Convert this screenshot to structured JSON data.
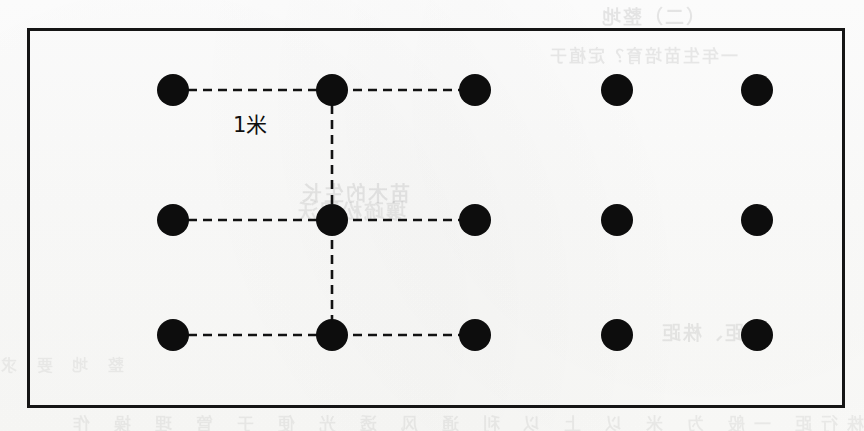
{
  "figure": {
    "kind": "planting-spacing-grid-diagram",
    "spacing_label": "1米",
    "frame": {
      "x": 27,
      "y": 28,
      "width": 818,
      "height": 380,
      "border_color": "#151515",
      "border_width": 3
    },
    "background_color": "#fdfdfc",
    "dot_color": "#0d0d0d",
    "dot_radius": 16,
    "line_color": "#121212",
    "line_style": "dashed",
    "columns": 5,
    "rows": 3,
    "column_x": [
      173,
      332,
      475,
      617,
      757
    ],
    "row_y": [
      90,
      220,
      335
    ],
    "dots": [
      {
        "id": "r1c1",
        "row": 1,
        "col": 1,
        "cx": 173,
        "cy": 90
      },
      {
        "id": "r1c2",
        "row": 1,
        "col": 2,
        "cx": 332,
        "cy": 90
      },
      {
        "id": "r1c3",
        "row": 1,
        "col": 3,
        "cx": 475,
        "cy": 90
      },
      {
        "id": "r1c4",
        "row": 1,
        "col": 4,
        "cx": 617,
        "cy": 90
      },
      {
        "id": "r1c5",
        "row": 1,
        "col": 5,
        "cx": 757,
        "cy": 90
      },
      {
        "id": "r2c1",
        "row": 2,
        "col": 1,
        "cx": 173,
        "cy": 220
      },
      {
        "id": "r2c2",
        "row": 2,
        "col": 2,
        "cx": 332,
        "cy": 220
      },
      {
        "id": "r2c3",
        "row": 2,
        "col": 3,
        "cx": 475,
        "cy": 220
      },
      {
        "id": "r2c4",
        "row": 2,
        "col": 4,
        "cx": 617,
        "cy": 220
      },
      {
        "id": "r2c5",
        "row": 2,
        "col": 5,
        "cx": 757,
        "cy": 220
      },
      {
        "id": "r3c1",
        "row": 3,
        "col": 1,
        "cx": 173,
        "cy": 335
      },
      {
        "id": "r3c2",
        "row": 3,
        "col": 2,
        "cx": 332,
        "cy": 335
      },
      {
        "id": "r3c3",
        "row": 3,
        "col": 3,
        "cx": 475,
        "cy": 335
      },
      {
        "id": "r3c4",
        "row": 3,
        "col": 4,
        "cx": 617,
        "cy": 335
      },
      {
        "id": "r3c5",
        "row": 3,
        "col": 5,
        "cx": 757,
        "cy": 335
      }
    ],
    "spacing_lines": [
      {
        "id": "h-row1",
        "orientation": "horizontal",
        "x1": 173,
        "y1": 90,
        "x2": 475,
        "y2": 90
      },
      {
        "id": "h-row2",
        "orientation": "horizontal",
        "x1": 173,
        "y1": 220,
        "x2": 475,
        "y2": 220
      },
      {
        "id": "h-row3",
        "orientation": "horizontal",
        "x1": 173,
        "y1": 335,
        "x2": 475,
        "y2": 335
      },
      {
        "id": "v-col2",
        "orientation": "vertical",
        "x1": 332,
        "y1": 90,
        "x2": 332,
        "y2": 335
      }
    ],
    "label_position": {
      "x": 233,
      "y": 108
    }
  },
  "bleed_through": {
    "note": "faint mirrored show-through text from the reverse side of the scanned page",
    "top_right": "（二）整地",
    "subtitle": "一年生苗培育？定植于",
    "center_1": "苗木的生长",
    "center_2": "壤疏松肥沃",
    "low_right": "行距、株距",
    "bottom_band": "株行距 一般 为 米 以 上 以 利 通 风 透 光 便 于 管 理 操 作",
    "left_edge": "整 地 要 求"
  }
}
